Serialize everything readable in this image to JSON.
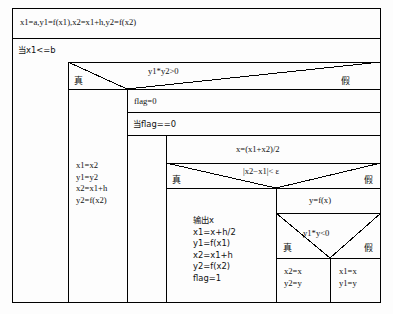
{
  "diagram": {
    "type": "nassi-shneiderman-flowchart",
    "title": "",
    "labels": {
      "true": "真",
      "false": "假"
    },
    "blocks": {
      "init": {
        "name": "init-statement",
        "text": "x1=a,y1=f(x1),x2=x1+h,y2=f(x2)"
      },
      "outer_loop": {
        "name": "outer-while-loop",
        "text": "当x1<=b"
      },
      "cond_sign": {
        "name": "condition-sign-product",
        "text": "y1*y2>0"
      },
      "advance_step": {
        "name": "advance-step-statement",
        "text": "x1=x2\ny1=y2\nx2=x1+h\ny2=f(x2)"
      },
      "flag_reset": {
        "name": "flag-reset-statement",
        "text": "flag=0"
      },
      "inner_loop": {
        "name": "inner-while-loop",
        "text": "当flag==0"
      },
      "midpoint": {
        "name": "midpoint-statement",
        "text": "x=(x1+x2)/2"
      },
      "cond_tol": {
        "name": "condition-tolerance",
        "text": "|x2−x1|< ε"
      },
      "output_block": {
        "name": "output-statement",
        "text": "输出x\nx1=x+h/2\ny1=f(x1)\nx2=x1+h\ny2=f(x2)\nflag=1"
      },
      "eval_fx": {
        "name": "evaluate-function-statement",
        "text": "y=f(x)"
      },
      "cond_bisect": {
        "name": "condition-bisection-sign",
        "text": "y1*y<0"
      },
      "assign_right": {
        "name": "assign-right-endpoint",
        "text": "x2=x\ny2=y"
      },
      "assign_left": {
        "name": "assign-left-endpoint",
        "text": "x1=x\ny1=y"
      }
    }
  }
}
